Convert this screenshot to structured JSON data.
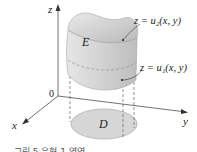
{
  "figure": {
    "axes": {
      "z_label": "z",
      "y_label": "y",
      "x_label": "x",
      "origin_label": "0"
    },
    "regions": {
      "solid_label": "E",
      "domain_label": "D"
    },
    "surfaces": {
      "upper": "z = u₂(x, y)",
      "lower": "z = u₁(x, y)"
    },
    "caption": "그림 5  유형 1 영역",
    "colors": {
      "solid_top": "#c8c8c8",
      "solid_side": "#dcdcdc",
      "domain_fill": "#d6d6d6",
      "axis": "#333333",
      "dashed": "#666666"
    }
  }
}
